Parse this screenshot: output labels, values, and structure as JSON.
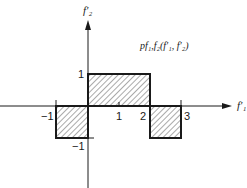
{
  "diagram": {
    "type": "piecewise-constant-2d-region-plot",
    "function_label": "p_{f1,f2}(f1', f2')",
    "function_label_display": "pf₁,f₂(f′₁, f′₂)",
    "x_axis": {
      "label": "f′₁",
      "ticks": [
        {
          "value": -1,
          "label": "−1"
        },
        {
          "value": 1,
          "label": "1"
        },
        {
          "value": 2,
          "label": "2"
        },
        {
          "value": 3,
          "label": "3"
        }
      ]
    },
    "y_axis": {
      "label": "f′₂",
      "ticks": [
        {
          "value": 1,
          "label": "1"
        },
        {
          "value": -1,
          "label": "−1"
        }
      ]
    },
    "regions": [
      {
        "name": "left-lower",
        "x": [
          -1,
          0
        ],
        "y": [
          -1,
          0
        ],
        "fill": "hatched"
      },
      {
        "name": "center-upper",
        "x": [
          0,
          2
        ],
        "y": [
          0,
          1
        ],
        "fill": "hatched"
      },
      {
        "name": "right-lower",
        "x": [
          2,
          3
        ],
        "y": [
          -1,
          0
        ],
        "fill": "hatched"
      }
    ],
    "colors": {
      "line": "#1a1a1a",
      "hatch": "#555555",
      "background": "#ffffff"
    }
  }
}
